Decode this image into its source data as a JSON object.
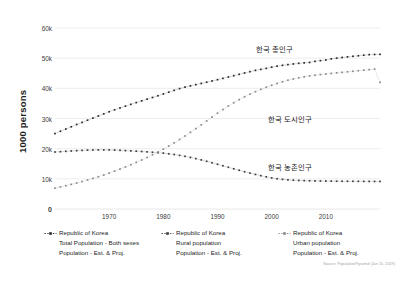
{
  "chart_data": {
    "type": "line",
    "title": "",
    "subtitle": "",
    "xlabel": "",
    "ylabel": "1000 persons",
    "xlim": [
      1960,
      2020
    ],
    "ylim": [
      0,
      60000
    ],
    "grid": true,
    "grid_axis": "y",
    "legend_position": "bottom",
    "y_ticks": [
      {
        "value": 0,
        "label": "0"
      },
      {
        "value": 10000,
        "label": "10k"
      },
      {
        "value": 20000,
        "label": "20k"
      },
      {
        "value": 30000,
        "label": "30k"
      },
      {
        "value": 40000,
        "label": "40k"
      },
      {
        "value": 50000,
        "label": "50k"
      },
      {
        "value": 60000,
        "label": "60k"
      }
    ],
    "x_ticks": [
      {
        "value": 1970,
        "label": "1970"
      },
      {
        "value": 1980,
        "label": "1980"
      },
      {
        "value": 1990,
        "label": "1990"
      },
      {
        "value": 2000,
        "label": "2000"
      },
      {
        "value": 2010,
        "label": "2010"
      }
    ],
    "x": [
      1960,
      1961,
      1962,
      1963,
      1964,
      1965,
      1966,
      1967,
      1968,
      1969,
      1970,
      1971,
      1972,
      1973,
      1974,
      1975,
      1976,
      1977,
      1978,
      1979,
      1980,
      1981,
      1982,
      1983,
      1984,
      1985,
      1986,
      1987,
      1988,
      1989,
      1990,
      1991,
      1992,
      1993,
      1994,
      1995,
      1996,
      1997,
      1998,
      1999,
      2000,
      2001,
      2002,
      2003,
      2004,
      2005,
      2006,
      2007,
      2008,
      2009,
      2010,
      2011,
      2012,
      2013,
      2014,
      2015,
      2016,
      2017,
      2018,
      2019,
      2020
    ],
    "series": [
      {
        "name": "Republic of Korea Total Population - Both sexes",
        "annotation": "한국 총인구",
        "color": "#2a2a2a",
        "values": [
          25012,
          25766,
          26513,
          27262,
          28010,
          28705,
          29436,
          30131,
          30838,
          31544,
          32241,
          32883,
          33505,
          34103,
          34692,
          35281,
          35849,
          36412,
          36969,
          37534,
          38124,
          38723,
          39326,
          39910,
          40406,
          40806,
          41214,
          41622,
          42031,
          42449,
          42869,
          43296,
          43748,
          44195,
          44642,
          45093,
          45525,
          45954,
          46287,
          46617,
          47008,
          47357,
          47622,
          47859,
          48082,
          48285,
          48438,
          48584,
          48949,
          49182,
          49410,
          49779,
          50004,
          50220,
          50424,
          50617,
          50802,
          50982,
          51171,
          51225,
          51269
        ]
      },
      {
        "name": "Republic of Korea Rural population",
        "annotation": "한국 농촌인구",
        "color": "#3d3d3d",
        "values": [
          18900,
          19000,
          19120,
          19230,
          19340,
          19430,
          19510,
          19560,
          19590,
          19600,
          19580,
          19530,
          19460,
          19370,
          19270,
          19170,
          19060,
          18940,
          18810,
          18670,
          18520,
          18300,
          18060,
          17780,
          17470,
          17100,
          16700,
          16270,
          15810,
          15330,
          14830,
          14330,
          13830,
          13330,
          12840,
          12360,
          11900,
          11460,
          11050,
          10660,
          10300,
          10040,
          9830,
          9670,
          9550,
          9470,
          9400,
          9350,
          9310,
          9280,
          9250,
          9230,
          9210,
          9200,
          9190,
          9180,
          9170,
          9160,
          9150,
          9140,
          9130
        ]
      },
      {
        "name": "Republic of Korea Urban population",
        "annotation": "한국 도시인구",
        "color": "#8a8a8a",
        "values": [
          6900,
          7300,
          7720,
          8160,
          8620,
          9100,
          9600,
          10130,
          10690,
          11280,
          11900,
          12550,
          13230,
          13940,
          14680,
          15450,
          16250,
          17090,
          17970,
          18890,
          19850,
          20860,
          21920,
          23040,
          24200,
          25400,
          26640,
          27900,
          29180,
          30470,
          31750,
          32980,
          34140,
          35230,
          36250,
          37200,
          38080,
          38900,
          39660,
          40360,
          41010,
          41620,
          42180,
          42680,
          43120,
          43500,
          43830,
          44110,
          44350,
          44560,
          44750,
          44940,
          45120,
          45300,
          45480,
          45660,
          45840,
          46020,
          46200,
          46390,
          42000
        ]
      }
    ]
  },
  "axis": {
    "y_title": "1000 persons"
  },
  "annotations": [
    {
      "text": "한국 총인구",
      "for": "total"
    },
    {
      "text": "한국 도시인구",
      "for": "urban"
    },
    {
      "text": "한국 농촌인구",
      "for": "rural"
    }
  ],
  "legend": {
    "items": [
      {
        "line1": "Republic of Korea",
        "line2": "Total Population - Both sexes",
        "line3": "Population - Est. & Proj.",
        "color": "#2a2a2a"
      },
      {
        "line1": "Republic of Korea",
        "line2": "Rural population",
        "line3": "Population - Est. & Proj.",
        "color": "#3d3d3d"
      },
      {
        "line1": "Republic of Korea",
        "line2": "Urban population",
        "line3": "Population - Est. & Proj.",
        "color": "#8a8a8a"
      }
    ]
  },
  "source": {
    "text": "Source: PopulationPyramid (Jan 15, 2019)"
  },
  "colors": {
    "background": "#ffffff",
    "grid": "#e8e8e8",
    "text": "#2b2b2b",
    "total": "#2a2a2a",
    "rural": "#3d3d3d",
    "urban": "#8a8a8a"
  }
}
